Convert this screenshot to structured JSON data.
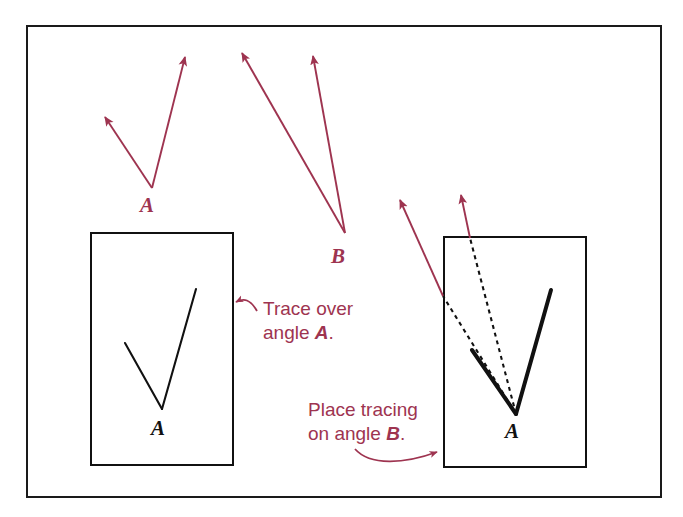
{
  "figure": {
    "background_color": "#ffffff",
    "frame": {
      "name": "outer-border",
      "color": "#1a1a1a",
      "x": 27,
      "y": 26,
      "width": 634,
      "height": 471,
      "stroke_width": 2
    },
    "colors": {
      "red_accent": "#9e3450",
      "black_ink": "#111111",
      "frame": "#1a1a1a"
    },
    "angles": {
      "A_top": {
        "label": "A",
        "label_x": 147,
        "label_y": 212,
        "vertex_x": 152,
        "vertex_y": 188,
        "ray1_tip_x": 105,
        "ray1_tip_y": 117,
        "ray2_tip_x": 185,
        "ray2_tip_y": 57,
        "color": "#9e3450"
      },
      "B_top": {
        "label": "B",
        "label_x": 338,
        "label_y": 263,
        "vertex_x": 345,
        "vertex_y": 233,
        "ray1_tip_x": 242,
        "ray1_tip_y": 53,
        "ray2_tip_x": 313,
        "ray2_tip_y": 56,
        "color": "#9e3450"
      }
    },
    "left_card": {
      "name": "tracing-paper-left",
      "x": 91,
      "y": 233,
      "width": 142,
      "height": 232,
      "stroke": "#111111",
      "vertex_label": "A",
      "vertex_label_x": 158,
      "vertex_label_y": 435,
      "vertex_x": 162,
      "vertex_y": 409,
      "ray1_x": 125,
      "ray1_y": 343,
      "ray2_x": 196,
      "ray2_y": 289
    },
    "right_card": {
      "name": "tracing-paper-right",
      "x": 444,
      "y": 237,
      "width": 142,
      "height": 230,
      "stroke": "#111111",
      "vertex_label": "A",
      "vertex_label_x": 512,
      "vertex_label_y": 438,
      "vertex_x": 516,
      "vertex_y": 414,
      "solid_ray1_x": 472,
      "solid_ray1_y": 350,
      "solid_ray2_x": 551,
      "solid_ray2_y": 290,
      "dashed_ray1_x": 443,
      "dashed_ray1_y": 296,
      "dashed_ray2_x": 470,
      "dashed_ray2_y": 238,
      "arrow1_tip_x": 400,
      "arrow1_tip_y": 200,
      "arrow2_tip_x": 461,
      "arrow2_tip_y": 195
    },
    "annotations": [
      {
        "name": "trace-over-angle-a-callout",
        "line1": "Trace over",
        "line2": "angle A.",
        "line2_plain": "angle ",
        "line2_italic": "A",
        "line2_period": ".",
        "text_x": 263,
        "text_y": 309,
        "text_y2": 333,
        "color": "#9e3450",
        "arrow_tip_x": 234,
        "arrow_tip_y": 302
      },
      {
        "name": "place-tracing-on-angle-b-callout",
        "line1": "Place tracing",
        "line2_plain": "on angle ",
        "line2_italic": "B",
        "line2_period": ".",
        "text_x": 308,
        "text_y": 410,
        "text_y2": 434,
        "color": "#9e3450",
        "arrow_tip_x": 440,
        "arrow_tip_y": 450
      }
    ]
  }
}
